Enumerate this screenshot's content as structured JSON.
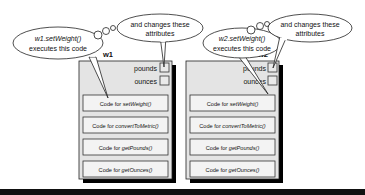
{
  "diagram": {
    "objects": [
      {
        "name": "w1",
        "call_bubble": {
          "line1": "w1.setWeight()",
          "line2": "executes this code"
        },
        "attr_bubble": {
          "line1": "and changes these",
          "line2": "attributes"
        },
        "attributes": [
          "pounds",
          "ounces"
        ],
        "methods": [
          {
            "prefix": "Code for ",
            "name": "setWeight()"
          },
          {
            "prefix": "Code for ",
            "name": "convertToMetric()"
          },
          {
            "prefix": "Code for ",
            "name": "getPounds()"
          },
          {
            "prefix": "Code for ",
            "name": "getOunces()"
          }
        ]
      },
      {
        "name": "w2",
        "call_bubble": {
          "line1": "w2.setWeight()",
          "line2": "executes this code"
        },
        "attr_bubble": {
          "line1": "and changes these",
          "line2": "attributes"
        },
        "attributes": [
          "pounds",
          "ounces"
        ],
        "methods": [
          {
            "prefix": "Code for ",
            "name": "setWeight()"
          },
          {
            "prefix": "Code for ",
            "name": "convertToMetric()"
          },
          {
            "prefix": "Code for ",
            "name": "getPounds()"
          },
          {
            "prefix": "Code for ",
            "name": "getOunces()"
          }
        ]
      }
    ],
    "colors": {
      "object_fill": "#e4e4e4",
      "method_fill": "#f2f2f2",
      "stroke": "#222222",
      "shadow": "#000000"
    }
  }
}
